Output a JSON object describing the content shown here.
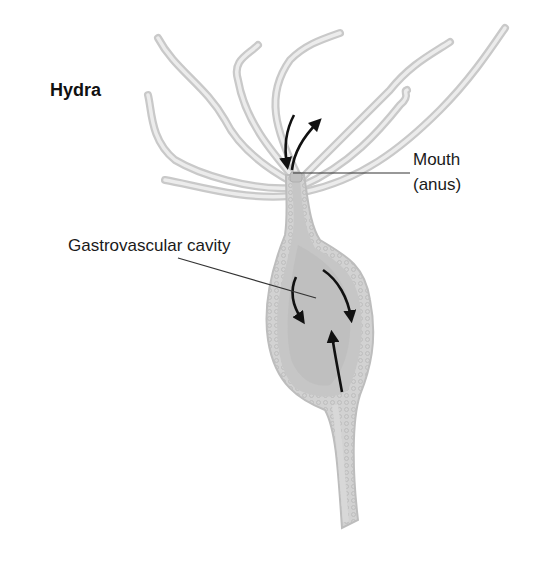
{
  "diagram": {
    "title": "Hydra",
    "labels": {
      "mouth": "Mouth",
      "mouth_sub": "(anus)",
      "cavity": "Gastrovascular cavity"
    },
    "arrows": [
      {
        "location": "mouth",
        "direction": "in"
      },
      {
        "location": "mouth",
        "direction": "out"
      },
      {
        "location": "cavity-left",
        "direction": "down"
      },
      {
        "location": "cavity-right",
        "direction": "down"
      },
      {
        "location": "cavity-center",
        "direction": "up"
      }
    ],
    "colors": {
      "body": "#d6d6d6",
      "body_outline": "#bdbdbd",
      "cavity": "#c4c4c4",
      "arrow": "#111111",
      "leader": "#333333"
    }
  }
}
